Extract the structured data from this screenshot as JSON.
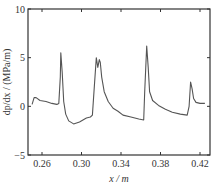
{
  "chart_data": {
    "type": "line",
    "title": "",
    "xlabel": "x / m",
    "ylabel": "dp/dx / (MPa/m)",
    "xlim": [
      0.25,
      0.43
    ],
    "ylim": [
      -5,
      10
    ],
    "xticks": [
      "0.26",
      "0.30",
      "0.34",
      "0.38",
      "0.42"
    ],
    "yticks": [
      "-5",
      "0",
      "5",
      "10"
    ],
    "grid": false,
    "legend": null,
    "series": [
      {
        "name": "pressure gradient",
        "color": "#555555",
        "x": [
          0.25,
          0.252,
          0.254,
          0.258,
          0.264,
          0.27,
          0.275,
          0.277,
          0.2785,
          0.279,
          0.2805,
          0.282,
          0.284,
          0.287,
          0.292,
          0.298,
          0.305,
          0.309,
          0.311,
          0.313,
          0.315,
          0.3165,
          0.318,
          0.319,
          0.3205,
          0.323,
          0.327,
          0.332,
          0.337,
          0.342,
          0.35,
          0.358,
          0.363,
          0.364,
          0.366,
          0.3675,
          0.369,
          0.372,
          0.378,
          0.385,
          0.392,
          0.4,
          0.407,
          0.409,
          0.4105,
          0.412,
          0.4135,
          0.416,
          0.42,
          0.425
        ],
        "y": [
          0.2,
          0.9,
          0.9,
          0.6,
          0.5,
          0.3,
          0.2,
          0.3,
          3.0,
          5.5,
          3.5,
          0.5,
          -0.8,
          -1.5,
          -1.8,
          -1.6,
          -1.2,
          -1.1,
          -0.9,
          2.0,
          5.0,
          4.0,
          4.8,
          4.5,
          3.0,
          1.5,
          0.5,
          -0.2,
          -0.5,
          -0.9,
          -1.1,
          -1.3,
          -1.4,
          1.5,
          6.2,
          4.0,
          1.5,
          0.6,
          0.1,
          -0.3,
          -0.6,
          -0.8,
          -0.9,
          0.0,
          2.5,
          1.8,
          0.8,
          0.4,
          0.3,
          0.3
        ]
      }
    ]
  }
}
